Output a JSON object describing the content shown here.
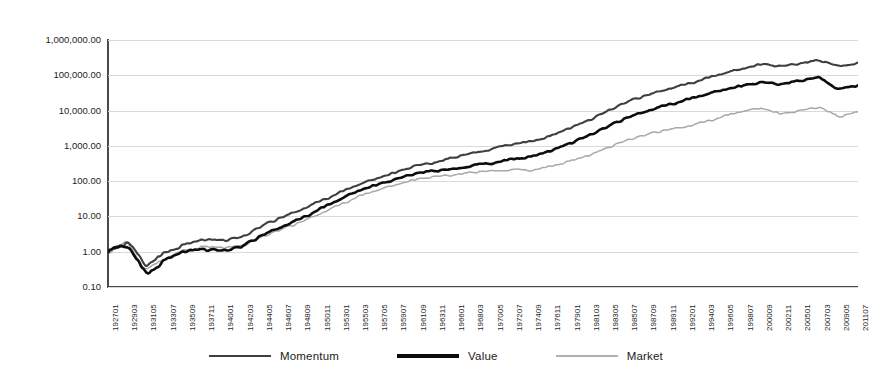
{
  "chart_data": {
    "type": "line",
    "title": "",
    "xlabel": "",
    "ylabel": "",
    "yscale": "log",
    "ylim": [
      0.1,
      1000000.0
    ],
    "grid": true,
    "legend_position": "bottom",
    "ytick_labels": [
      "1,000,000.00",
      "100,000.00",
      "10,000.00",
      "1,000.00",
      "100.00",
      "10.00",
      "1.00",
      "0.10"
    ],
    "ytick_values": [
      1000000,
      100000,
      10000,
      1000,
      100,
      10,
      1,
      0.1
    ],
    "categories": [
      "192701",
      "192903",
      "193105",
      "193307",
      "193509",
      "193711",
      "194001",
      "194203",
      "194405",
      "194607",
      "194809",
      "195011",
      "195301",
      "195503",
      "195705",
      "195907",
      "196109",
      "196311",
      "196601",
      "196803",
      "197005",
      "197207",
      "197409",
      "197611",
      "197901",
      "198103",
      "198305",
      "198507",
      "198709",
      "198911",
      "199201",
      "199403",
      "199605",
      "199807",
      "200009",
      "200211",
      "200501",
      "200703",
      "200905",
      "201107"
    ],
    "series": [
      {
        "name": "Momentum",
        "color": "#3f3f3f",
        "width": 2.1,
        "values": [
          1.0,
          1.95,
          0.42,
          0.95,
          1.55,
          2.15,
          2.05,
          2.6,
          5.3,
          9.2,
          15.5,
          27.0,
          46.0,
          78.0,
          118.0,
          176.0,
          270.0,
          330.0,
          470.0,
          620.0,
          830.0,
          1150.0,
          1320.0,
          1850.0,
          3100.0,
          5200.0,
          9800.0,
          17500.0,
          27000.0,
          40000.0,
          55000.0,
          78000.0,
          112000.0,
          150000.0,
          205000.0,
          175000.0,
          215000.0,
          265000.0,
          175000.0,
          230000.0
        ]
      },
      {
        "name": "Value",
        "color": "#0d0d0d",
        "width": 2.6,
        "values": [
          1.0,
          1.7,
          0.22,
          0.58,
          1.0,
          1.15,
          1.05,
          1.4,
          2.9,
          5.1,
          8.6,
          16.0,
          29.0,
          52.0,
          78.0,
          112.0,
          165.0,
          195.0,
          215.0,
          285.0,
          330.0,
          420.0,
          480.0,
          700.0,
          1150.0,
          1950.0,
          3500.0,
          6300.0,
          9800.0,
          14200.0,
          19500.0,
          27500.0,
          38000.0,
          50000.0,
          62000.0,
          55000.0,
          70000.0,
          86000.0,
          40000.0,
          52000.0
        ]
      },
      {
        "name": "Market",
        "color": "#a8a8a8",
        "width": 1.5,
        "values": [
          1.0,
          1.8,
          0.3,
          0.68,
          1.1,
          1.35,
          1.25,
          1.45,
          2.6,
          4.2,
          6.8,
          12.0,
          21.0,
          36.0,
          55.0,
          78.0,
          110.0,
          132.0,
          148.0,
          178.0,
          190.0,
          215.0,
          205.0,
          260.0,
          360.0,
          520.0,
          880.0,
          1450.0,
          2050.0,
          2800.0,
          3500.0,
          4800.0,
          6800.0,
          9500.0,
          11500.0,
          7800.0,
          9800.0,
          12500.0,
          6500.0,
          9200.0
        ]
      }
    ],
    "legend": [
      {
        "label": "Momentum",
        "color": "#3f3f3f",
        "width": 2.1
      },
      {
        "label": "Value",
        "color": "#0d0d0d",
        "width": 3.2
      },
      {
        "label": "Market",
        "color": "#b0b0b0",
        "width": 1.4
      }
    ]
  },
  "colors": {
    "background": "#ffffff",
    "axis": "#4a4a4a",
    "gridline": "#d9d9d9",
    "text": "#1a1a1a",
    "momentum": "#3f3f3f",
    "value": "#0d0d0d",
    "market": "#a8a8a8"
  }
}
